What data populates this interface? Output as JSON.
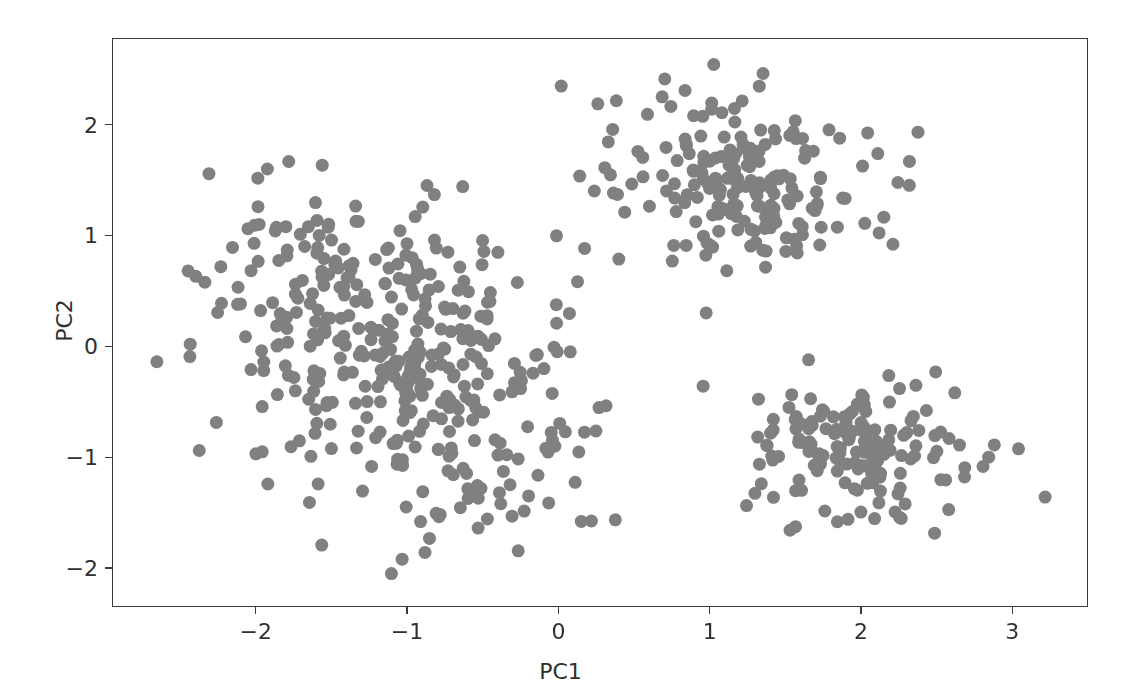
{
  "figure": {
    "width": 1121,
    "height": 700,
    "background": "#ffffff"
  },
  "axes": {
    "plot_left": 112,
    "plot_top": 38,
    "plot_width": 976,
    "plot_height": 569,
    "spine_color": "#3b3b3b",
    "tick_color": "#3b3b3b",
    "label_color": "#303030"
  },
  "chart_data": {
    "type": "scatter",
    "title": "",
    "xlabel": "PC1",
    "ylabel": "PC2",
    "xlim": [
      -2.95,
      3.5
    ],
    "ylim": [
      -2.35,
      2.78
    ],
    "xticks": [
      -2,
      -1,
      0,
      1,
      2,
      3
    ],
    "xticklabels": [
      "−2",
      "−1",
      "0",
      "1",
      "2",
      "3"
    ],
    "yticks": [
      -2,
      -1,
      0,
      1,
      2
    ],
    "yticklabels": [
      "−2",
      "−1",
      "0",
      "1",
      "2"
    ],
    "grid": false,
    "legend": null,
    "marker": {
      "shape": "circle",
      "color": "#808080",
      "edge_color": "none",
      "size_px": 13,
      "alpha": 1.0
    },
    "n_points_total": 780,
    "clusters": [
      {
        "name": "cluster-left",
        "n": 420,
        "center": [
          -1.08,
          -0.1
        ],
        "sigma": [
          0.62,
          0.78
        ],
        "correlation": -0.42,
        "x_range": [
          -2.7,
          0.4
        ],
        "y_range": [
          -2.1,
          1.7
        ]
      },
      {
        "name": "cluster-upper-right",
        "n": 195,
        "center": [
          1.2,
          1.48
        ],
        "sigma": [
          0.45,
          0.37
        ],
        "correlation": -0.1,
        "x_range": [
          -0.1,
          2.4
        ],
        "y_range": [
          0.3,
          2.56
        ]
      },
      {
        "name": "cluster-lower-right",
        "n": 165,
        "center": [
          2.02,
          -0.87
        ],
        "sigma": [
          0.4,
          0.33
        ],
        "correlation": 0.05,
        "x_range": [
          0.9,
          3.25
        ],
        "y_range": [
          -1.9,
          0.15
        ]
      }
    ],
    "notable_outliers": [
      {
        "x": -2.66,
        "y": -0.13
      },
      {
        "x": -2.38,
        "y": -0.93
      },
      {
        "x": 3.21,
        "y": -1.35
      },
      {
        "x": 2.37,
        "y": 1.94
      },
      {
        "x": 1.02,
        "y": 2.55
      },
      {
        "x": -1.11,
        "y": -2.04
      },
      {
        "x": 0.97,
        "y": 0.31
      },
      {
        "x": 0.95,
        "y": -0.35
      },
      {
        "x": 0.3,
        "y": 1.62
      }
    ]
  }
}
